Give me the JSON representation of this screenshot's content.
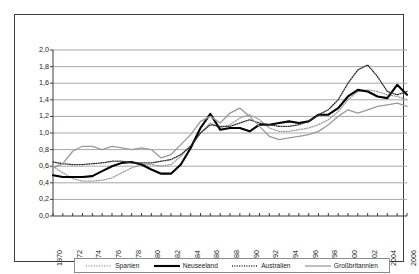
{
  "chart_data": {
    "type": "line",
    "title": "",
    "xlabel": "",
    "ylabel": "",
    "ylim": [
      0.0,
      2.0
    ],
    "ytick_labels": [
      "0,0",
      "0,2",
      "0,4",
      "0,6",
      "0,8",
      "1,0",
      "1,2",
      "1,4",
      "1,6",
      "1,8",
      "2,0"
    ],
    "ytick_values": [
      0.0,
      0.2,
      0.4,
      0.6,
      0.8,
      1.0,
      1.2,
      1.4,
      1.6,
      1.8,
      2.0
    ],
    "grid": true,
    "legend_position": "bottom",
    "x": [
      1970,
      1971,
      1972,
      1973,
      1974,
      1975,
      1976,
      1977,
      1978,
      1979,
      1980,
      1981,
      1982,
      1983,
      1984,
      1985,
      1986,
      1987,
      1988,
      1989,
      1990,
      1991,
      1992,
      1993,
      1994,
      1995,
      1996,
      1997,
      1998,
      1999,
      2000,
      2001,
      2002,
      2003,
      2004,
      2005,
      2006
    ],
    "xtick_labels": [
      "1970",
      "1972",
      "1974",
      "1976",
      "1978",
      "1980",
      "1982",
      "1984",
      "1986",
      "1988",
      "1990",
      "1992",
      "1994",
      "1996",
      "1998",
      "2000",
      "2002",
      "2004",
      "2006"
    ],
    "series": [
      {
        "name": "Spanien",
        "style": "dotted-light",
        "color": "#9a9a9a",
        "values": [
          0.6,
          0.52,
          0.45,
          0.42,
          0.42,
          0.43,
          0.46,
          0.52,
          0.58,
          0.62,
          0.62,
          0.6,
          0.62,
          0.72,
          0.85,
          1.0,
          1.12,
          1.06,
          1.1,
          1.18,
          1.22,
          1.16,
          1.06,
          1.02,
          1.02,
          1.04,
          1.06,
          1.1,
          1.16,
          1.26,
          1.4,
          1.5,
          1.52,
          1.5,
          1.46,
          1.44,
          1.4
        ]
      },
      {
        "name": "Neuseeland",
        "style": "solid-thick",
        "color": "#000000",
        "values": [
          0.49,
          0.47,
          0.47,
          0.47,
          0.48,
          0.54,
          0.6,
          0.64,
          0.65,
          0.62,
          0.56,
          0.51,
          0.51,
          0.62,
          0.82,
          1.06,
          1.23,
          1.04,
          1.06,
          1.06,
          1.02,
          1.1,
          1.1,
          1.12,
          1.14,
          1.12,
          1.14,
          1.22,
          1.22,
          1.3,
          1.44,
          1.52,
          1.5,
          1.44,
          1.42,
          1.58,
          1.46
        ]
      },
      {
        "name": "Australien",
        "style": "dotted-dark",
        "color": "#2b2b2b",
        "values": [
          0.65,
          0.63,
          0.62,
          0.62,
          0.63,
          0.64,
          0.66,
          0.66,
          0.64,
          0.64,
          0.64,
          0.66,
          0.68,
          0.74,
          0.84,
          1.0,
          1.1,
          1.08,
          1.08,
          1.12,
          1.16,
          1.12,
          1.1,
          1.08,
          1.08,
          1.1,
          1.14,
          1.22,
          1.28,
          1.4,
          1.6,
          1.76,
          1.82,
          1.68,
          1.5,
          1.46,
          1.5
        ]
      },
      {
        "name": "Großbritannien",
        "style": "solid-gray",
        "color": "#9a9a9a",
        "values": [
          0.58,
          0.63,
          0.78,
          0.84,
          0.84,
          0.8,
          0.84,
          0.82,
          0.8,
          0.82,
          0.8,
          0.7,
          0.74,
          0.86,
          0.98,
          1.14,
          1.2,
          1.12,
          1.24,
          1.3,
          1.2,
          1.08,
          0.96,
          0.92,
          0.94,
          0.96,
          0.98,
          1.02,
          1.1,
          1.2,
          1.28,
          1.24,
          1.28,
          1.32,
          1.34,
          1.36,
          1.32
        ]
      }
    ]
  },
  "legend": {
    "items": [
      {
        "label": "Spanien"
      },
      {
        "label": "Neuseeland"
      },
      {
        "label": "Australien"
      },
      {
        "label": "Großbritannien"
      }
    ]
  }
}
